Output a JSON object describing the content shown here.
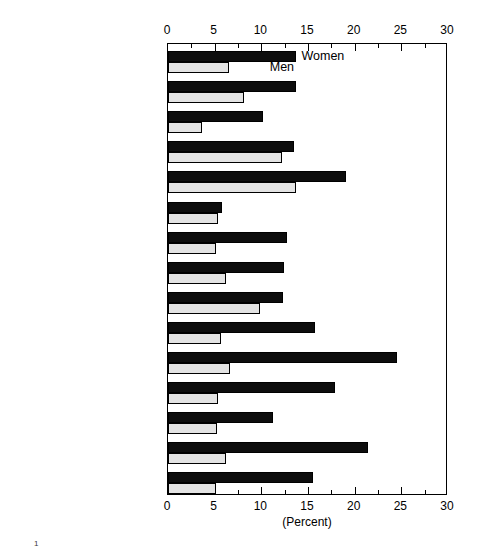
{
  "chart_data": {
    "type": "bar",
    "orientation": "horizontal",
    "title": "",
    "subtitle": "",
    "xlabel": "(Percent)",
    "ylabel": "",
    "xlim": [
      0,
      30
    ],
    "xticks": [
      0,
      5,
      10,
      15,
      20,
      25,
      30
    ],
    "xtick_labels": [
      "0",
      "5",
      "10",
      "15",
      "20",
      "25",
      "30"
    ],
    "minor_tick_interval": 2.5,
    "grid": false,
    "axis_top": true,
    "axis_bottom": true,
    "legend_position": "inside-top-left",
    "categories": [
      "Total",
      "Scientists, total",
      "Physical",
      "Mathematical",
      "Computer specialists",
      "Environmental",
      "Life",
      "Psychologists",
      "Social",
      "Engineers, total",
      "Aeronautical/astronautical",
      "Chemical",
      "Civil",
      "Electrical/electronics",
      "Mechanical"
    ],
    "category_bold": [
      true,
      true,
      false,
      false,
      false,
      false,
      false,
      false,
      false,
      true,
      false,
      false,
      false,
      false,
      false
    ],
    "category_footnote_marker": [
      "",
      "",
      "",
      "",
      "",
      "",
      "",
      "",
      "",
      "1",
      "",
      "",
      "",
      "",
      ""
    ],
    "series": [
      {
        "name": "Women",
        "color": "#0d0d0d",
        "values": [
          13.7,
          13.7,
          10.2,
          13.5,
          19.1,
          5.8,
          12.8,
          12.4,
          12.3,
          15.8,
          24.5,
          17.9,
          11.3,
          21.4,
          15.5
        ]
      },
      {
        "name": "Men",
        "color": "#e3e3e3",
        "values": [
          6.5,
          8.1,
          3.6,
          12.2,
          13.7,
          5.4,
          5.1,
          6.2,
          9.9,
          5.7,
          6.6,
          5.4,
          5.3,
          6.2,
          5.1
        ]
      }
    ],
    "annotations": [
      {
        "text": "Women",
        "x": 14.3,
        "category_index": 0,
        "series": "Women"
      },
      {
        "text": "Men",
        "x": 10.9,
        "category_index": 0,
        "series": "Men"
      }
    ]
  },
  "footnote": {
    "marker": "1",
    "text": ""
  }
}
